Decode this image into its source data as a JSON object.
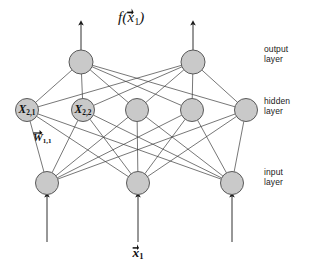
{
  "figure": {
    "type": "neural-network-diagram",
    "title": {
      "symbol": "f",
      "open": "(",
      "variable": "x",
      "subscript": "1",
      "close": ")",
      "full_text": "f(x⃗1)"
    },
    "bottom_label": {
      "variable": "x",
      "subscript": "1",
      "full_text": "x⃗1"
    },
    "layer_labels": [
      {
        "id": "output",
        "line1": "output",
        "line2": "layer",
        "x": 264,
        "y": 49
      },
      {
        "id": "hidden",
        "line1": "hidden",
        "line2": "layer",
        "x": 264,
        "y": 101
      },
      {
        "id": "input",
        "line1": "input",
        "line2": "layer",
        "x": 264,
        "y": 172
      }
    ],
    "node_labels": [
      {
        "id": "x21",
        "variable": "X",
        "subscript": "2,1",
        "x": 27,
        "y": 110
      },
      {
        "id": "x22",
        "variable": "X",
        "subscript": "2,2",
        "x": 83,
        "y": 110
      }
    ],
    "weight_labels": [
      {
        "id": "w11",
        "variable": "W",
        "subscript": "1,1",
        "x": 33,
        "y": 131
      }
    ],
    "layers": [
      {
        "id": "output-layer",
        "name": "output layer",
        "y": 62,
        "radius": 12,
        "nodes": [
          {
            "id": "out-1",
            "x": 81
          },
          {
            "id": "out-2",
            "x": 193
          }
        ]
      },
      {
        "id": "hidden-layer",
        "name": "hidden layer",
        "y": 110,
        "radius": 11.5,
        "nodes": [
          {
            "id": "hid-1",
            "x": 27
          },
          {
            "id": "hid-2",
            "x": 83
          },
          {
            "id": "hid-3",
            "x": 137
          },
          {
            "id": "hid-4",
            "x": 192
          },
          {
            "id": "hid-5",
            "x": 246
          }
        ]
      },
      {
        "id": "input-layer",
        "name": "input layer",
        "y": 183,
        "radius": 11.5,
        "nodes": [
          {
            "id": "in-1",
            "x": 47
          },
          {
            "id": "in-2",
            "x": 138
          },
          {
            "id": "in-3",
            "x": 232
          }
        ]
      }
    ],
    "output_arrows": [
      {
        "id": "out-arrow-1",
        "x": 81,
        "y_from": 50,
        "y_to": 23
      },
      {
        "id": "out-arrow-2",
        "x": 193,
        "y_from": 50,
        "y_to": 23
      }
    ],
    "input_arrows": [
      {
        "id": "in-arrow-1",
        "x": 47,
        "y_from": 242,
        "y_to": 195
      },
      {
        "id": "in-arrow-2",
        "x": 138,
        "y_from": 242,
        "y_to": 195
      },
      {
        "id": "in-arrow-3",
        "x": 232,
        "y_from": 242,
        "y_to": 195
      }
    ],
    "colors": {
      "node_fill": "#c9c9c9",
      "node_stroke": "#5a5a5a",
      "edge": "#3c3c3c",
      "arrow": "#1a1a1a",
      "text": "#111111",
      "background": "#ffffff"
    }
  }
}
